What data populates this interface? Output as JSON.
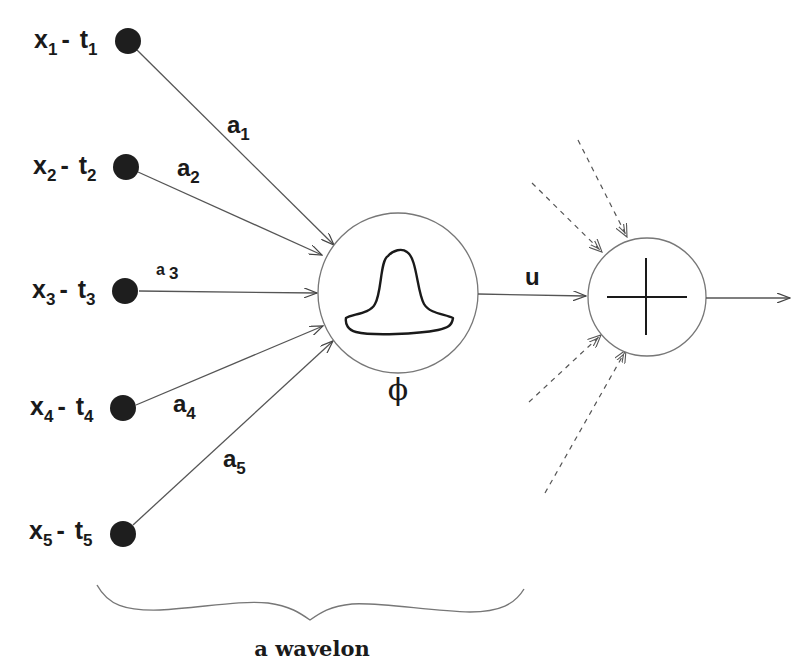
{
  "diagram": {
    "colors": {
      "node_fill": "#1e1e1e",
      "line": "#555555",
      "text": "#1a1a1a"
    },
    "inputs": [
      {
        "x": "x",
        "x_sub": "1",
        "sep": "-",
        "t": "t",
        "t_sub": "1",
        "weight": "a",
        "weight_sub": "1"
      },
      {
        "x": "x",
        "x_sub": "2",
        "sep": "-",
        "t": "t",
        "t_sub": "2",
        "weight": "a",
        "weight_sub": "2"
      },
      {
        "x": "x",
        "x_sub": "3",
        "sep": "-",
        "t": "t",
        "t_sub": "3",
        "weight": "a",
        "weight_sub": "3"
      },
      {
        "x": "x",
        "x_sub": "4",
        "sep": "-",
        "t": "t",
        "t_sub": "4",
        "weight": "a",
        "weight_sub": "4"
      },
      {
        "x": "x",
        "x_sub": "5",
        "sep": "-",
        "t": "t",
        "t_sub": "5",
        "weight": "a",
        "weight_sub": "5"
      }
    ],
    "wavelon": {
      "activation_symbol": "ϕ",
      "activation_icon": "bell-curve-icon"
    },
    "output_edge_label": "u",
    "summation": {
      "symbol_icon": "plus-icon"
    },
    "caption": "a wavelon"
  }
}
